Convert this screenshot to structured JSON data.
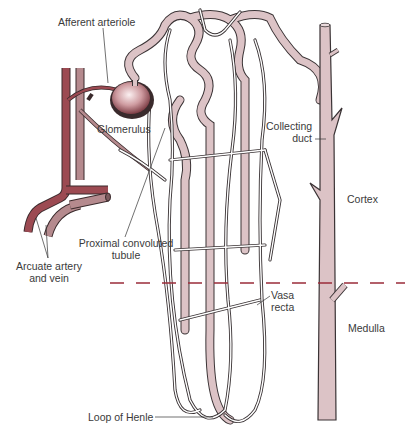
{
  "diagram": {
    "colors": {
      "tubule_fill": "#dcc3c6",
      "tubule_stroke": "#3a3335",
      "artery": "#9c4a52",
      "vein": "#b58a8e",
      "glomerulus_light": "#f4e4e6",
      "glomerulus_dark": "#8c4b52",
      "boundary_dash": "#9b2d3a",
      "label_text": "#3a3a3a"
    },
    "labels": {
      "afferent_arteriole": "Afferent arteriole",
      "glomerulus": "Glomerulus",
      "proximal_line1": "Proximal convoluted",
      "proximal_line2": "tubule",
      "arcuate_line1": "Arcuate artery",
      "arcuate_line2": "and vein",
      "collecting_line1": "Collecting",
      "collecting_line2": "duct",
      "cortex": "Cortex",
      "vasa_line1": "Vasa",
      "vasa_line2": "recta",
      "medulla": "Medulla",
      "loop_of_henle": "Loop of Henle"
    },
    "regions": [
      "Cortex",
      "Medulla"
    ]
  }
}
